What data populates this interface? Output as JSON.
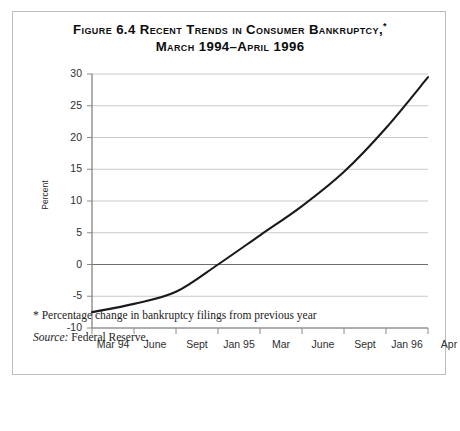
{
  "figure": {
    "title_line1": "Figure 6.4 Recent Trends in Consumer Bankruptcy,",
    "title_marker": "*",
    "title_line2": "March 1994–April 1996",
    "footnote": "* Percentage change in bankruptcy filings from previous year",
    "source_lead": "Source:",
    "source_body": " Federal Reserve."
  },
  "chart_data": {
    "type": "line",
    "xlabel": "",
    "ylabel": "Percent",
    "ylim": [
      -10,
      30
    ],
    "ytick_labels": [
      "30",
      "25",
      "20",
      "15",
      "10",
      "5",
      "0",
      "-5",
      "-10"
    ],
    "ytick_values": [
      30,
      25,
      20,
      15,
      10,
      5,
      0,
      -5,
      -10
    ],
    "xtick_labels": [
      "Mar 94",
      "June",
      "Sept",
      "Jan 95",
      "Mar",
      "June",
      "Sept",
      "Jan 96",
      "Apr"
    ],
    "grid": true,
    "legend": "none",
    "series": [
      {
        "name": "Percentage change in bankruptcy filings from previous year",
        "color": "#1a1a1a",
        "x": [
          "Mar 94",
          "June",
          "Sept",
          "Jan 95",
          "Mar",
          "June",
          "Sept",
          "Jan 96",
          "Apr"
        ],
        "values": [
          -7.5,
          -6.2,
          -4.3,
          0.0,
          4.6,
          9.2,
          14.6,
          21.5,
          29.5
        ]
      }
    ]
  }
}
